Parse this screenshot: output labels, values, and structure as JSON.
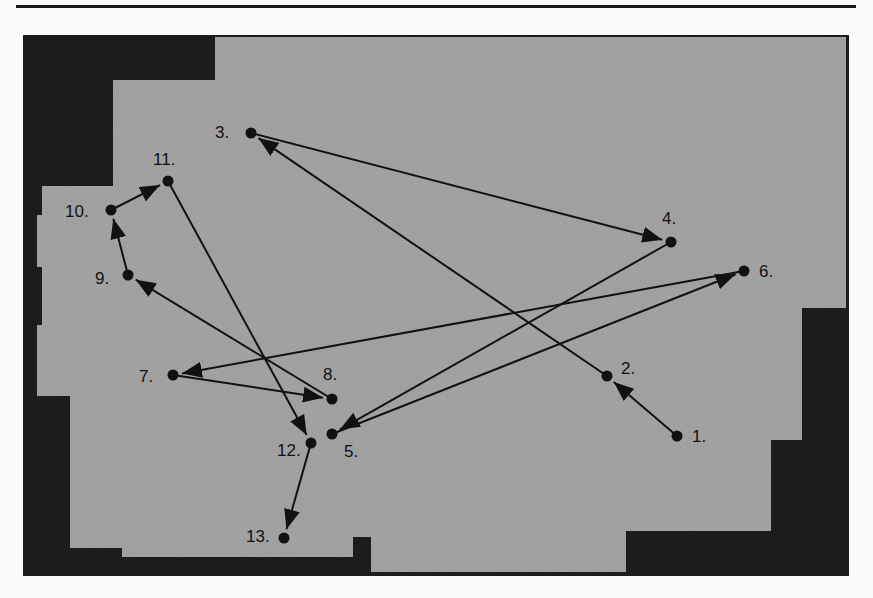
{
  "diagram": {
    "type": "floor-plan-path",
    "colors": {
      "floor": "#a8a8a8",
      "wall": "#1c1c1c",
      "ink": "#111111",
      "page": "#fbfbfb"
    },
    "points": [
      {
        "id": "1",
        "label": "1.",
        "x": 677,
        "y": 436,
        "lx": 692,
        "ly": 442
      },
      {
        "id": "2",
        "label": "2.",
        "x": 607,
        "y": 376,
        "lx": 621,
        "ly": 374
      },
      {
        "id": "3",
        "label": "3.",
        "x": 251,
        "y": 133,
        "lx": 215,
        "ly": 138
      },
      {
        "id": "4",
        "label": "4.",
        "x": 671,
        "y": 242,
        "lx": 662,
        "ly": 224
      },
      {
        "id": "5",
        "label": "5.",
        "x": 332,
        "y": 434,
        "lx": 344,
        "ly": 457
      },
      {
        "id": "6",
        "label": "6.",
        "x": 744,
        "y": 271,
        "lx": 759,
        "ly": 277
      },
      {
        "id": "7",
        "label": "7.",
        "x": 173,
        "y": 375,
        "lx": 139,
        "ly": 382
      },
      {
        "id": "8",
        "label": "8.",
        "x": 332,
        "y": 399,
        "lx": 323,
        "ly": 380
      },
      {
        "id": "9",
        "label": "9.",
        "x": 128,
        "y": 275,
        "lx": 95,
        "ly": 284
      },
      {
        "id": "10",
        "label": "10.",
        "x": 111,
        "y": 210,
        "lx": 65,
        "ly": 217
      },
      {
        "id": "11",
        "label": "11.",
        "x": 168,
        "y": 181,
        "lx": 153,
        "ly": 165
      },
      {
        "id": "12",
        "label": "12.",
        "x": 311,
        "y": 443,
        "lx": 277,
        "ly": 456
      },
      {
        "id": "13",
        "label": "13.",
        "x": 284,
        "y": 538,
        "lx": 246,
        "ly": 542
      }
    ],
    "path_order": [
      "1",
      "2",
      "3",
      "4",
      "5",
      "6",
      "7",
      "8",
      "9",
      "10",
      "11",
      "12",
      "13"
    ]
  }
}
